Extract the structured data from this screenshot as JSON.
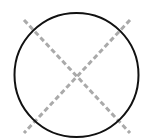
{
  "diagram": {
    "background": "#ffffff",
    "circle": {
      "cx": 76.5,
      "cy": 75,
      "r": 62,
      "stroke": "#111111",
      "stroke_width": 2
    },
    "diagonals": [
      {
        "x1": 24,
        "y1": 20,
        "x2": 130,
        "y2": 133
      },
      {
        "x1": 130,
        "y1": 20,
        "x2": 24,
        "y2": 133
      }
    ],
    "diagonal_style": {
      "stroke": "#aaaaaa",
      "stroke_width": 3,
      "dasharray": "5 3"
    }
  }
}
